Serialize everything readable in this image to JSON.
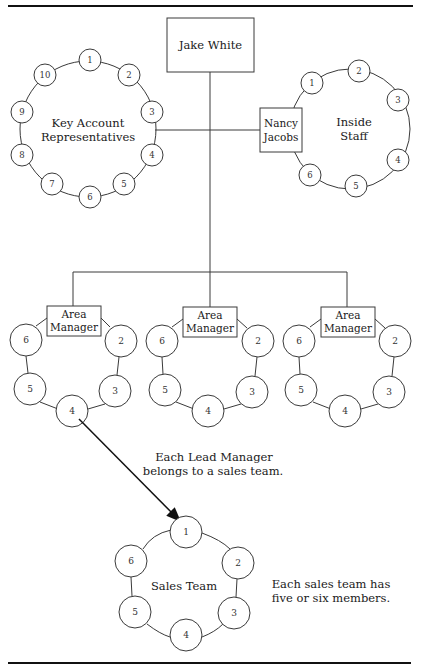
{
  "diagram": {
    "top_box": {
      "label": "Jake White"
    },
    "liaison_box": {
      "line1": "Nancy",
      "line2": "Jacobs"
    },
    "key_accounts": {
      "line1": "Key Account",
      "line2": "Representatives",
      "members": [
        "1",
        "2",
        "3",
        "4",
        "5",
        "6",
        "7",
        "8",
        "9",
        "10"
      ]
    },
    "inside_staff": {
      "line1": "Inside",
      "line2": "Staff",
      "members": [
        "1",
        "2",
        "3",
        "4",
        "5",
        "6"
      ]
    },
    "area_groups": [
      {
        "line1": "Area",
        "line2": "Manager",
        "members": [
          "2",
          "3",
          "4",
          "5",
          "6"
        ]
      },
      {
        "line1": "Area",
        "line2": "Manager",
        "members": [
          "2",
          "3",
          "4",
          "5",
          "6"
        ]
      },
      {
        "line1": "Area",
        "line2": "Manager",
        "members": [
          "2",
          "3",
          "4",
          "5",
          "6"
        ]
      }
    ],
    "arrow_note": {
      "line1": "Each Lead Manager",
      "line2": "belongs to a sales team."
    },
    "sales_team": {
      "label": "Sales Team",
      "members": [
        "1",
        "2",
        "3",
        "4",
        "5",
        "6"
      ]
    },
    "sales_note": {
      "line1": "Each sales team has",
      "line2": "five or six members."
    },
    "colors": {
      "line": "#3a3a3a",
      "text": "#1a1a1a",
      "background": "#ffffff"
    }
  }
}
